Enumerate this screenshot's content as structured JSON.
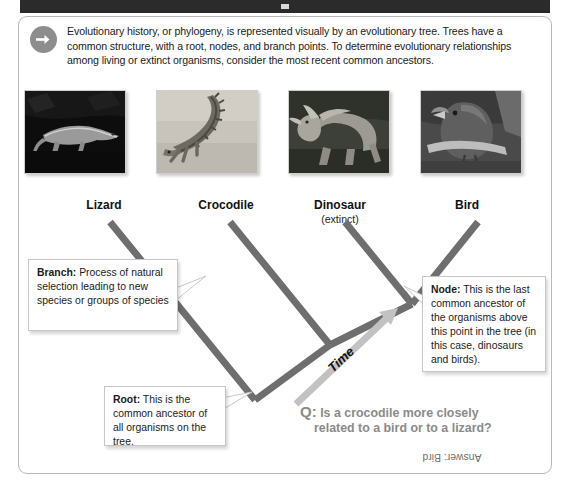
{
  "titlebar": {
    "pip": ""
  },
  "intro": {
    "icon": "arrow-right-circle-icon",
    "text": "Evolutionary history, or phylogeny, is represented visually by an evolutionary tree. Trees have a common structure, with a root, nodes, and branch points. To determine evolutionary relationships among living or extinct organisms, consider the most recent common ancestors."
  },
  "organisms": [
    {
      "label": "Lizard",
      "sublabel": "",
      "photo_alt": "lizard-photo"
    },
    {
      "label": "Crocodile",
      "sublabel": "",
      "photo_alt": "crocodile-photo"
    },
    {
      "label": "Dinosaur",
      "sublabel": "(extinct)",
      "photo_alt": "dinosaur-photo"
    },
    {
      "label": "Bird",
      "sublabel": "",
      "photo_alt": "bird-photo"
    }
  ],
  "callouts": {
    "branch": {
      "term": "Branch:",
      "text": " Process of natural selection leading to new species or groups of species"
    },
    "node": {
      "term": "Node:",
      "text": " This is the last common ancestor of the organisms above this point in the tree (in this case, dinosaurs and birds)."
    },
    "root": {
      "term": "Root:",
      "text": " This is the common ancestor of all organisms on the tree."
    }
  },
  "time_axis": {
    "label": "Time"
  },
  "question": {
    "marker": "Q:",
    "line1": "Is a crocodile more closely",
    "line2": "related to a bird or to a lizard?",
    "answer": "Answer: Bird"
  },
  "colors": {
    "branch_gray": "#6e6e6e",
    "time_arrow_gray": "#c2c2c2",
    "question_gray": "#8a8a8a",
    "panel_border": "#b9b9b9",
    "titlebar": "#2b2b2b"
  }
}
